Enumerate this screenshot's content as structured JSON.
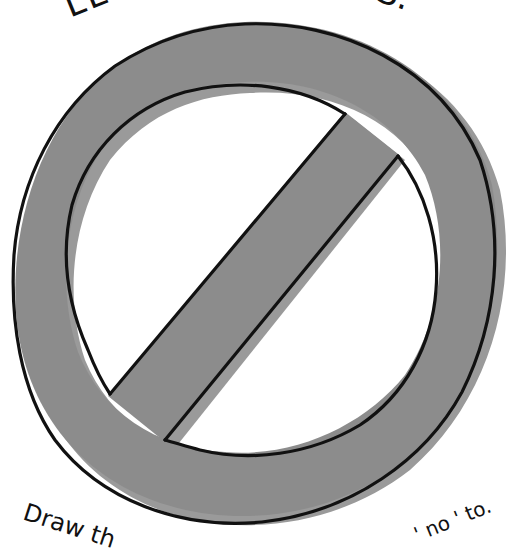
{
  "illustration": {
    "subject": "prohibition sign (no symbol)",
    "fill_color": "#8c8c8c",
    "shadow_color": "#9a9a9a",
    "outline_color": "#111111",
    "background_color": "#ffffff"
  },
  "text": {
    "top_left_fragment": "LE",
    "top_right_fragment": "S.",
    "bottom_left_fragment": "Draw th",
    "bottom_right_fragment": "' no ' to."
  }
}
